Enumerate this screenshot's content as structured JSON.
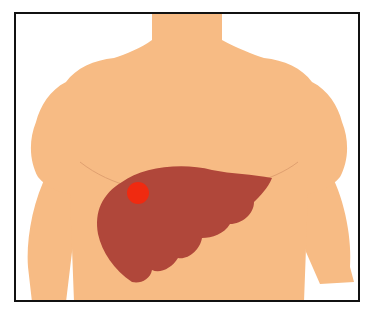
{
  "figure": {
    "colors": {
      "skin": "#F7BB84",
      "skin_line": "#E0A070",
      "liver": "#B0473A",
      "tumor": "#F02A10",
      "frame": "#111111",
      "background": "#FFFFFF"
    },
    "labels": {
      "torso": "torso",
      "liver": "liver",
      "tumor": "tumor"
    }
  }
}
